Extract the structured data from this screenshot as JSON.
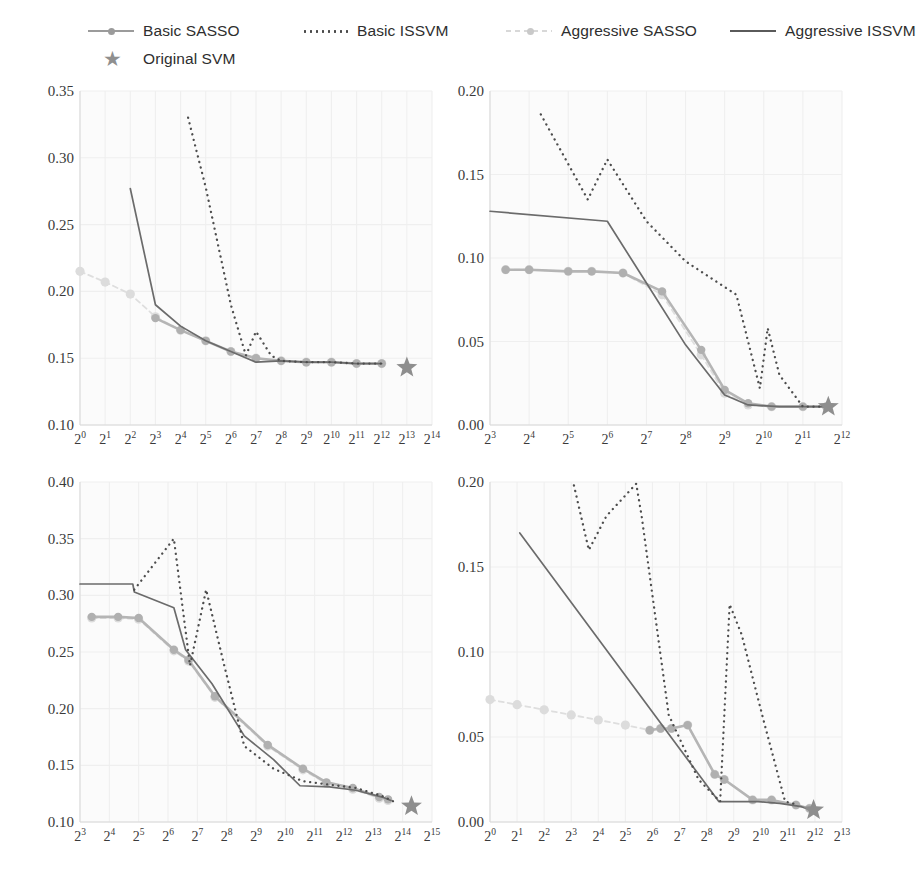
{
  "legend": {
    "items": [
      {
        "label": "Basic SASSO",
        "key": "line-with-circle-marker",
        "color": "#b5b5b5"
      },
      {
        "label": "Basic ISSVM",
        "key": "dotted-line",
        "color": "#4d4d4d"
      },
      {
        "label": "Aggressive SASSO",
        "key": "faint-dashed-with-dot",
        "color": "#dedede"
      },
      {
        "label": "Aggressive ISSVM",
        "key": "solid-line",
        "color": "#6b6b6b"
      },
      {
        "label": "Original SVM",
        "key": "star-marker",
        "color": "#8e8e8e"
      }
    ]
  },
  "chart_data": [
    {
      "id": "top-left",
      "type": "line",
      "title": "",
      "xlabel": "",
      "ylabel": "",
      "xscale": "log2",
      "xticks": [
        "2^0",
        "2^1",
        "2^2",
        "2^3",
        "2^4",
        "2^5",
        "2^6",
        "2^7",
        "2^8",
        "2^9",
        "2^10",
        "2^11",
        "2^12",
        "2^13",
        "2^14"
      ],
      "xlim": [
        0,
        14
      ],
      "yticks": [
        0.1,
        0.15,
        0.2,
        0.25,
        0.3,
        0.35
      ],
      "ylim": [
        0.1,
        0.35
      ],
      "grid": true,
      "legend_position": "figure-top",
      "series": [
        {
          "name": "Basic SASSO",
          "x": [
            3,
            4,
            5,
            6,
            7,
            8,
            9,
            10,
            11,
            12
          ],
          "y": [
            0.18,
            0.171,
            0.163,
            0.155,
            0.15,
            0.148,
            0.147,
            0.147,
            0.146,
            0.146
          ]
        },
        {
          "name": "Basic ISSVM",
          "x": [
            4.3,
            5,
            6,
            6.6,
            7,
            7.6,
            8,
            9,
            10,
            11,
            12
          ],
          "y": [
            0.33,
            0.278,
            0.19,
            0.152,
            0.17,
            0.152,
            0.148,
            0.147,
            0.147,
            0.146,
            0.146
          ]
        },
        {
          "name": "Aggressive SASSO",
          "x": [
            0,
            1,
            2,
            3,
            4,
            5,
            6,
            7,
            8,
            9,
            10,
            11,
            12
          ],
          "y": [
            0.215,
            0.207,
            0.198,
            0.181,
            0.171,
            0.163,
            0.155,
            0.15,
            0.148,
            0.147,
            0.147,
            0.146,
            0.146
          ]
        },
        {
          "name": "Aggressive ISSVM",
          "x": [
            2,
            3,
            4,
            5,
            6,
            7,
            8,
            9,
            10,
            11,
            12
          ],
          "y": [
            0.277,
            0.19,
            0.174,
            0.163,
            0.155,
            0.147,
            0.148,
            0.147,
            0.147,
            0.146,
            0.146
          ]
        },
        {
          "name": "Original SVM",
          "x": [
            13
          ],
          "y": [
            0.143
          ],
          "marker": "star"
        }
      ]
    },
    {
      "id": "top-right",
      "type": "line",
      "title": "",
      "xlabel": "",
      "ylabel": "",
      "xscale": "log2",
      "xticks": [
        "2^3",
        "2^4",
        "2^5",
        "2^6",
        "2^7",
        "2^8",
        "2^9",
        "2^10",
        "2^11",
        "2^12"
      ],
      "xlim": [
        3,
        12
      ],
      "yticks": [
        0.0,
        0.05,
        0.1,
        0.15,
        0.2
      ],
      "ylim": [
        0.0,
        0.2
      ],
      "grid": true,
      "legend_position": "figure-top",
      "series": [
        {
          "name": "Basic SASSO",
          "x": [
            3.4,
            4,
            5,
            5.6,
            6.4,
            7.4,
            8.4,
            9,
            9.6,
            10.2,
            11,
            11.6
          ],
          "y": [
            0.093,
            0.093,
            0.092,
            0.092,
            0.091,
            0.08,
            0.045,
            0.021,
            0.013,
            0.011,
            0.011,
            0.011
          ]
        },
        {
          "name": "Basic ISSVM",
          "x": [
            4.3,
            5.5,
            6,
            7,
            8,
            9.3,
            9.9,
            10.1,
            10.4,
            11,
            11.6
          ],
          "y": [
            0.186,
            0.135,
            0.159,
            0.122,
            0.098,
            0.078,
            0.022,
            0.058,
            0.03,
            0.011,
            0.011
          ]
        },
        {
          "name": "Aggressive SASSO",
          "x": [
            3.4,
            4,
            5,
            5.6,
            6.4,
            7.4,
            8.4,
            9,
            9.6,
            10.2,
            11,
            11.6
          ],
          "y": [
            0.093,
            0.093,
            0.092,
            0.092,
            0.091,
            0.078,
            0.042,
            0.019,
            0.012,
            0.011,
            0.011,
            0.011
          ]
        },
        {
          "name": "Aggressive ISSVM",
          "x": [
            3,
            6,
            7,
            8,
            9,
            9.6,
            10.4,
            11.3,
            11.7
          ],
          "y": [
            0.128,
            0.122,
            0.085,
            0.048,
            0.018,
            0.012,
            0.011,
            0.011,
            0.011
          ]
        },
        {
          "name": "Original SVM",
          "x": [
            11.65
          ],
          "y": [
            0.011
          ],
          "marker": "star"
        }
      ]
    },
    {
      "id": "bottom-left",
      "type": "line",
      "title": "",
      "xlabel": "",
      "ylabel": "",
      "xscale": "log2",
      "xticks": [
        "2^3",
        "2^4",
        "2^5",
        "2^6",
        "2^7",
        "2^8",
        "2^9",
        "2^10",
        "2^11",
        "2^12",
        "2^13",
        "2^14",
        "2^15"
      ],
      "xlim": [
        3,
        15
      ],
      "yticks": [
        0.1,
        0.15,
        0.2,
        0.25,
        0.3,
        0.35,
        0.4
      ],
      "ylim": [
        0.1,
        0.4
      ],
      "grid": true,
      "legend_position": "figure-top",
      "series": [
        {
          "name": "Basic SASSO",
          "x": [
            3.4,
            4.3,
            5,
            6.2,
            6.7,
            7.6,
            9.4,
            10.6,
            11.4,
            12.3,
            13.2,
            13.5
          ],
          "y": [
            0.281,
            0.281,
            0.28,
            0.252,
            0.243,
            0.211,
            0.168,
            0.147,
            0.135,
            0.13,
            0.122,
            0.12
          ]
        },
        {
          "name": "Basic ISSVM",
          "x": [
            4.85,
            6.2,
            6.75,
            7.3,
            7.9,
            8.6,
            9.6,
            10.6,
            11.5,
            12.4,
            13.3,
            13.7
          ],
          "y": [
            0.305,
            0.35,
            0.238,
            0.305,
            0.24,
            0.167,
            0.147,
            0.136,
            0.133,
            0.13,
            0.123,
            0.118
          ]
        },
        {
          "name": "Aggressive SASSO",
          "x": [
            3.4,
            4.3,
            5,
            6.2,
            6.7,
            7.6,
            9.4,
            10.6,
            11.4,
            12.3,
            13.2,
            13.5
          ],
          "y": [
            0.28,
            0.28,
            0.279,
            0.251,
            0.242,
            0.21,
            0.167,
            0.146,
            0.134,
            0.129,
            0.121,
            0.119
          ]
        },
        {
          "name": "Aggressive ISSVM",
          "x": [
            3,
            4.8,
            4.85,
            6.2,
            6.6,
            7.5,
            8.6,
            9.6,
            10.5,
            11.5,
            12.4,
            13.3,
            13.6
          ],
          "y": [
            0.31,
            0.31,
            0.303,
            0.289,
            0.252,
            0.222,
            0.176,
            0.155,
            0.132,
            0.131,
            0.128,
            0.122,
            0.119
          ]
        },
        {
          "name": "Original SVM",
          "x": [
            14.3
          ],
          "y": [
            0.114
          ],
          "marker": "star"
        }
      ]
    },
    {
      "id": "bottom-right",
      "type": "line",
      "title": "",
      "xlabel": "",
      "ylabel": "",
      "xscale": "log2",
      "xticks": [
        "2^0",
        "2^1",
        "2^2",
        "2^3",
        "2^4",
        "2^5",
        "2^6",
        "2^7",
        "2^8",
        "2^9",
        "2^10",
        "2^11",
        "2^12",
        "2^13"
      ],
      "xlim": [
        0,
        13
      ],
      "yticks": [
        0.0,
        0.05,
        0.1,
        0.15,
        0.2
      ],
      "ylim": [
        0.0,
        0.2
      ],
      "grid": true,
      "legend_position": "figure-top",
      "series": [
        {
          "name": "Basic SASSO",
          "x": [
            5.9,
            6.3,
            6.7,
            7.3,
            8.3,
            8.65,
            9.7,
            10.4,
            11.3,
            11.8
          ],
          "y": [
            0.054,
            0.055,
            0.055,
            0.057,
            0.028,
            0.025,
            0.013,
            0.013,
            0.01,
            0.008
          ]
        },
        {
          "name": "Basic ISSVM",
          "x": [
            3.1,
            3.65,
            4.3,
            5.4,
            5.6,
            6.6,
            7.7,
            8.5,
            8.85,
            9.3,
            10.1,
            10.9,
            11.4
          ],
          "y": [
            0.198,
            0.16,
            0.18,
            0.199,
            0.18,
            0.063,
            0.025,
            0.012,
            0.128,
            0.11,
            0.06,
            0.012,
            0.01
          ]
        },
        {
          "name": "Aggressive SASSO",
          "x": [
            0,
            1,
            2,
            3,
            4,
            5,
            5.9,
            6.3,
            6.7,
            7.3,
            8.3,
            8.65,
            9.7,
            10.4,
            11.3,
            11.8
          ],
          "y": [
            0.072,
            0.069,
            0.066,
            0.063,
            0.06,
            0.057,
            0.054,
            0.055,
            0.055,
            0.057,
            0.028,
            0.025,
            0.013,
            0.013,
            0.01,
            0.008
          ]
        },
        {
          "name": "Aggressive ISSVM",
          "x": [
            1.1,
            8.45,
            9.1,
            9.9,
            10.7,
            11.5,
            11.9
          ],
          "y": [
            0.17,
            0.012,
            0.012,
            0.012,
            0.011,
            0.009,
            0.007
          ]
        },
        {
          "name": "Original SVM",
          "x": [
            11.95
          ],
          "y": [
            0.007
          ],
          "marker": "star"
        }
      ]
    }
  ]
}
